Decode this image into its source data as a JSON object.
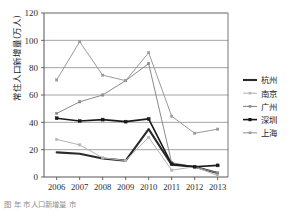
{
  "figure": {
    "caption": "图         年      市人口新增量   市     ",
    "background": "#ffffff"
  },
  "axis": {
    "y_label": "常住人口新增量(万人)",
    "y_ticks": [
      "0",
      "20",
      "40",
      "60",
      "80",
      "100",
      "120"
    ],
    "x_ticks": [
      "2006",
      "2007",
      "2008",
      "2009",
      "2010",
      "2011",
      "2012",
      "2013"
    ]
  },
  "legend": {
    "position": "right",
    "entries": [
      {
        "label": "杭州",
        "color": "#2b2b2b",
        "marker": "none",
        "width": 2.1
      },
      {
        "label": "南京",
        "color": "#b5b5b5",
        "marker": "square",
        "width": 1.0
      },
      {
        "label": "广州",
        "color": "#8a8a8a",
        "marker": "square",
        "width": 1.0
      },
      {
        "label": "深圳",
        "color": "#1a1a1a",
        "marker": "square",
        "width": 1.6
      },
      {
        "label": "上海",
        "color": "#9a9a9a",
        "marker": "square",
        "width": 1.0
      }
    ]
  },
  "chart_data": {
    "type": "line",
    "title": "",
    "xlabel": "",
    "ylabel": "常住人口新增量(万人)",
    "categories": [
      "2006",
      "2007",
      "2008",
      "2009",
      "2010",
      "2011",
      "2012",
      "2013"
    ],
    "ylim": [
      0,
      120
    ],
    "ytick_step": 20,
    "grid": "horizontal",
    "legend_position": "right",
    "series": [
      {
        "name": "杭州",
        "color": "#2b2b2b",
        "values": [
          18.0,
          17.0,
          13.5,
          12.0,
          35.0,
          9.0,
          7.5,
          3.0
        ]
      },
      {
        "name": "南京",
        "color": "#b5b5b5",
        "values": [
          27.5,
          23.5,
          14.0,
          12.0,
          29.0,
          5.0,
          7.5,
          1.0
        ]
      },
      {
        "name": "广州",
        "color": "#8a8a8a",
        "values": [
          46.5,
          55.0,
          60.0,
          70.5,
          83.0,
          10.5,
          7.5,
          3.0
        ]
      },
      {
        "name": "深圳",
        "color": "#1a1a1a",
        "values": [
          43.0,
          41.0,
          42.0,
          40.5,
          42.5,
          9.5,
          7.5,
          8.5
        ]
      },
      {
        "name": "上海",
        "color": "#9a9a9a",
        "values": [
          71.0,
          99.0,
          74.5,
          70.5,
          91.0,
          44.5,
          32.0,
          35.0
        ]
      }
    ]
  },
  "colors": {
    "frame": "#555555",
    "gridline": "#8c8c8c",
    "text": "#2b2b2b"
  }
}
